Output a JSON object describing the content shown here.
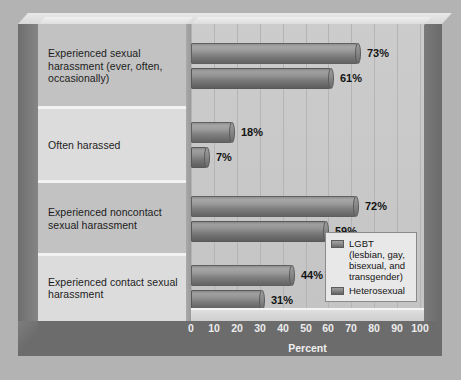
{
  "chart_data": {
    "type": "bar",
    "orientation": "horizontal",
    "title": "",
    "xlabel": "Percent",
    "ylabel": "",
    "xlim": [
      0,
      100
    ],
    "xticks": [
      "0",
      "10",
      "20",
      "30",
      "40",
      "50",
      "60",
      "70",
      "80",
      "90",
      "100"
    ],
    "grid": true,
    "legend_position": "inside-bottom-right",
    "categories": [
      "Experienced sexual harassment (ever, often, occasionally)",
      "Often harassed",
      "Experienced noncontact sexual harassment",
      "Experienced contact sexual harassment"
    ],
    "series": [
      {
        "name": "LGBT (lesbian, gay, bisexual, and transgender)",
        "values": [
          73,
          18,
          72,
          44
        ],
        "labels": [
          "73%",
          "18%",
          "72%",
          "44%"
        ],
        "color": "#8d8d8d"
      },
      {
        "name": "Heterosexual",
        "values": [
          61,
          7,
          59,
          31
        ],
        "labels": [
          "61%",
          "7%",
          "59%",
          "31%"
        ],
        "color": "#868686"
      }
    ]
  },
  "legend": {
    "entries": [
      {
        "label": "LGBT (lesbian, gay, bisexual, and transgender)"
      },
      {
        "label": "Heterosexual"
      }
    ]
  },
  "axis": {
    "title": "Percent"
  },
  "colors": {
    "page_background": "#b3b3b3",
    "plot_background": "#c8c8c8",
    "label_panel": "#d2d2d2",
    "frame_dark": "#6c6c6c",
    "gridline": "#b4b4b4",
    "axis_text": "#ededed",
    "data_label_text": "#141414"
  }
}
